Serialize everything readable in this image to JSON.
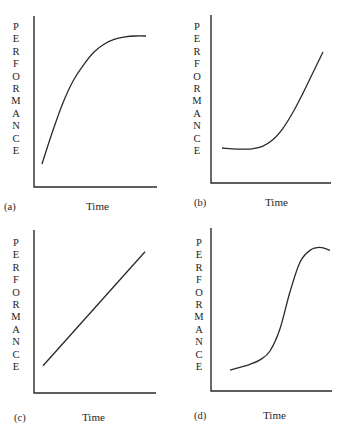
{
  "chart_data": [
    {
      "type": "line",
      "panel_label": "(a)",
      "title": "",
      "xlabel": "Time",
      "ylabel": "PERFORMANCE",
      "xlim": [
        0,
        100
      ],
      "ylim": [
        0,
        100
      ],
      "grid": false,
      "x": [
        0,
        10,
        20,
        30,
        40,
        50,
        60,
        70,
        80,
        90,
        100
      ],
      "y": [
        10,
        30,
        48,
        62,
        72,
        80,
        85,
        88,
        89.5,
        90,
        90
      ]
    },
    {
      "type": "line",
      "panel_label": "(b)",
      "title": "",
      "xlabel": "Time",
      "ylabel": "PERFORMANCE",
      "xlim": [
        0,
        100
      ],
      "ylim": [
        0,
        100
      ],
      "grid": false,
      "x": [
        0,
        10,
        20,
        30,
        40,
        50,
        60,
        70,
        80,
        90,
        100
      ],
      "y": [
        20,
        19.5,
        19.3,
        19.5,
        21,
        25,
        32,
        42,
        54,
        67,
        80
      ]
    },
    {
      "type": "line",
      "panel_label": "(c)",
      "title": "",
      "xlabel": "Time",
      "ylabel": "PERFORMANCE",
      "xlim": [
        0,
        100
      ],
      "ylim": [
        0,
        100
      ],
      "grid": false,
      "x": [
        0,
        100
      ],
      "y": [
        15,
        92
      ]
    },
    {
      "type": "line",
      "panel_label": "(d)",
      "title": "",
      "xlabel": "Time",
      "ylabel": "PERFORMANCE",
      "xlim": [
        0,
        100
      ],
      "ylim": [
        0,
        100
      ],
      "grid": false,
      "x": [
        0,
        10,
        20,
        30,
        40,
        50,
        60,
        70,
        80,
        90,
        100
      ],
      "y": [
        12,
        14,
        16,
        19,
        25,
        40,
        65,
        85,
        93,
        95,
        93
      ]
    }
  ]
}
